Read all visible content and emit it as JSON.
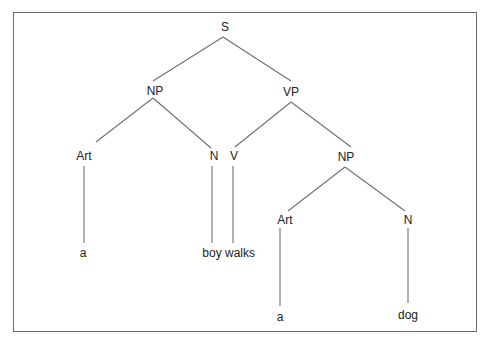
{
  "diagram": {
    "type": "parse-tree",
    "nodes": [
      {
        "id": "S",
        "label": "S",
        "x": 225,
        "y": 27
      },
      {
        "id": "NP1",
        "label": "NP",
        "x": 155,
        "y": 91
      },
      {
        "id": "VP",
        "label": "VP",
        "x": 291,
        "y": 92
      },
      {
        "id": "Art1",
        "label": "Art",
        "x": 84,
        "y": 156
      },
      {
        "id": "N1",
        "label": "N",
        "x": 214,
        "y": 156
      },
      {
        "id": "V",
        "label": "V",
        "x": 234,
        "y": 156
      },
      {
        "id": "NP2",
        "label": "NP",
        "x": 346,
        "y": 157
      },
      {
        "id": "a1",
        "label": "a",
        "x": 83,
        "y": 253
      },
      {
        "id": "boy",
        "label": "boy",
        "x": 212,
        "y": 253
      },
      {
        "id": "walks",
        "label": "walks",
        "x": 240,
        "y": 253
      },
      {
        "id": "Art2",
        "label": "Art",
        "x": 285,
        "y": 220
      },
      {
        "id": "N2",
        "label": "N",
        "x": 408,
        "y": 220
      },
      {
        "id": "a2",
        "label": "a",
        "x": 280,
        "y": 317
      },
      {
        "id": "dog",
        "label": "dog",
        "x": 408,
        "y": 315
      }
    ],
    "edges": [
      {
        "from": "S",
        "to": "NP1",
        "x1": 223,
        "y1": 37,
        "x2": 153,
        "y2": 81
      },
      {
        "from": "S",
        "to": "VP",
        "x1": 223,
        "y1": 37,
        "x2": 291,
        "y2": 81
      },
      {
        "from": "NP1",
        "to": "Art1",
        "x1": 153,
        "y1": 98,
        "x2": 96,
        "y2": 142
      },
      {
        "from": "NP1",
        "to": "N1",
        "x1": 153,
        "y1": 98,
        "x2": 211,
        "y2": 148
      },
      {
        "from": "VP",
        "to": "V",
        "x1": 291,
        "y1": 102,
        "x2": 235,
        "y2": 147
      },
      {
        "from": "VP",
        "to": "NP2",
        "x1": 291,
        "y1": 102,
        "x2": 351,
        "y2": 147
      },
      {
        "from": "Art1",
        "to": "a1",
        "x1": 84,
        "y1": 166,
        "x2": 84,
        "y2": 243
      },
      {
        "from": "N1",
        "to": "boy",
        "x1": 212,
        "y1": 166,
        "x2": 212,
        "y2": 243
      },
      {
        "from": "V",
        "to": "walks",
        "x1": 233,
        "y1": 166,
        "x2": 233,
        "y2": 243
      },
      {
        "from": "NP2",
        "to": "Art2",
        "x1": 345,
        "y1": 167,
        "x2": 288,
        "y2": 211
      },
      {
        "from": "NP2",
        "to": "N2",
        "x1": 345,
        "y1": 167,
        "x2": 405,
        "y2": 211
      },
      {
        "from": "Art2",
        "to": "a2",
        "x1": 280,
        "y1": 228,
        "x2": 280,
        "y2": 306
      },
      {
        "from": "N2",
        "to": "dog",
        "x1": 408,
        "y1": 228,
        "x2": 408,
        "y2": 303
      }
    ]
  }
}
